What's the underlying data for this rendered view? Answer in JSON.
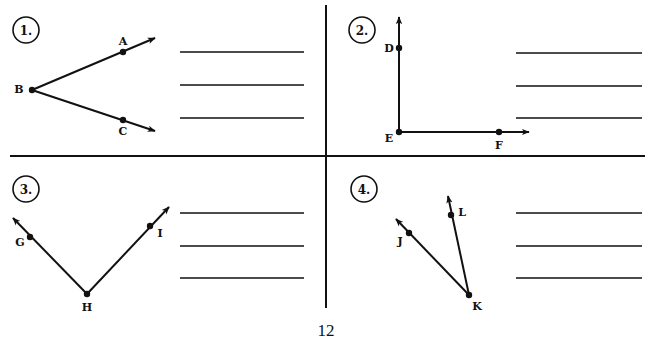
{
  "worksheet": {
    "page_number": "12",
    "problems": [
      {
        "number": "1.",
        "vertex": "B",
        "points": [
          "A",
          "B",
          "C"
        ],
        "answer_lines": 3
      },
      {
        "number": "2.",
        "vertex": "E",
        "points": [
          "D",
          "E",
          "F"
        ],
        "answer_lines": 3
      },
      {
        "number": "3.",
        "vertex": "H",
        "points": [
          "G",
          "H",
          "I"
        ],
        "answer_lines": 3
      },
      {
        "number": "4.",
        "vertex": "K",
        "points": [
          "J",
          "K",
          "L"
        ],
        "answer_lines": 3
      }
    ]
  }
}
